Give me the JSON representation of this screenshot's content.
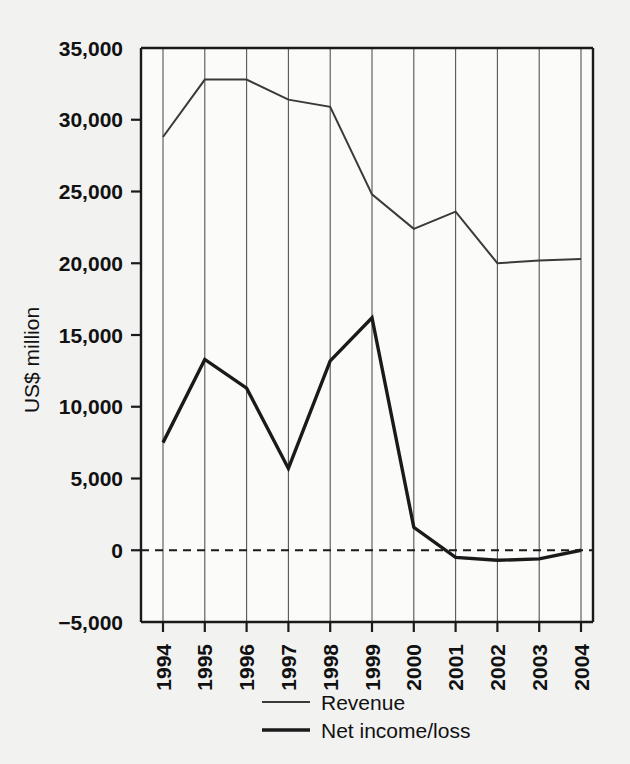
{
  "chart_data": {
    "type": "line",
    "title": "",
    "xlabel": "",
    "ylabel": "US$ million",
    "categories": [
      "1994",
      "1995",
      "1996",
      "1997",
      "1998",
      "1999",
      "2000",
      "2001",
      "2002",
      "2003",
      "2004"
    ],
    "ylim": [
      -5000,
      35000
    ],
    "ytick_values": [
      35000,
      30000,
      25000,
      20000,
      15000,
      10000,
      5000,
      0,
      -5000
    ],
    "ytick_labels": [
      "35,000",
      "30,000",
      "25,000",
      "20,000",
      "15,000",
      "10,000",
      "5,000",
      "0",
      "-5,000"
    ],
    "grid": "vertical",
    "zero_line": true,
    "legend_position": "bottom-center",
    "series": [
      {
        "name": "Revenue",
        "color": "#3a3a3a",
        "line_width": 2,
        "values": [
          28800,
          32800,
          32800,
          31400,
          30900,
          24800,
          22400,
          23600,
          20000,
          20200,
          20300
        ]
      },
      {
        "name": "Net income/loss",
        "color": "#1a1a1a",
        "line_width": 3.4,
        "values": [
          7500,
          13300,
          11300,
          5700,
          13200,
          16200,
          1600,
          -500,
          -700,
          -600,
          0
        ]
      }
    ]
  },
  "legend": {
    "items": [
      {
        "label": "Revenue"
      },
      {
        "label": "Net income/loss"
      }
    ]
  },
  "axes": {
    "y_title": "US$ million"
  },
  "colors": {
    "background": "#f2f2f1",
    "plot_background": "#fbfbfa",
    "axis": "#1a1a1a",
    "gridline": "#555555",
    "revenue": "#3a3a3a",
    "net_income": "#1a1a1a"
  }
}
